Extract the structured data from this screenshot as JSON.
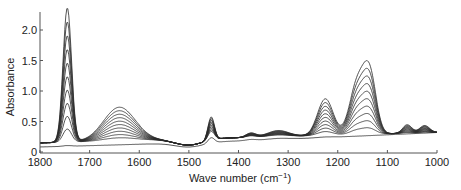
{
  "chart_data": {
    "type": "line",
    "title": "",
    "xlabel": "Wave number (cm⁻¹)",
    "xlabel_base": "Wave number (cm",
    "xlabel_sup": "−1",
    "xlabel_close": ")",
    "ylabel": "Absorbance",
    "xlim": [
      1800,
      1000
    ],
    "ylim": [
      0,
      2.3
    ],
    "x_ticks": [
      1800,
      1700,
      1600,
      1500,
      1400,
      1300,
      1200,
      1100,
      1000
    ],
    "x_tick_labels": [
      "1800",
      "1700",
      "1600",
      "1500",
      "1400",
      "1300",
      "1200",
      "1100",
      "1000"
    ],
    "y_ticks": [
      0,
      0.5,
      1.0,
      1.5,
      2.0
    ],
    "y_tick_labels": [
      "0",
      "0.5",
      "1.0",
      "1.5",
      "2.0"
    ],
    "grid": false,
    "legend": null,
    "series_count": 11,
    "peaks": [
      {
        "center": 1745,
        "width": 12,
        "max_height": 2.2,
        "min_height": 0.02
      },
      {
        "center": 1640,
        "width": 45,
        "max_height": 0.55,
        "min_height": 0.0
      },
      {
        "center": 1455,
        "width": 9,
        "max_height": 0.38,
        "min_height": 0.12
      },
      {
        "center": 1375,
        "width": 14,
        "max_height": 0.07,
        "min_height": 0.02
      },
      {
        "center": 1320,
        "width": 30,
        "max_height": 0.1,
        "min_height": 0.02
      },
      {
        "center": 1225,
        "width": 22,
        "max_height": 0.6,
        "min_height": 0.01
      },
      {
        "center": 1160,
        "width": 22,
        "max_height": 0.85,
        "min_height": 0.0
      },
      {
        "center": 1135,
        "width": 18,
        "max_height": 0.9,
        "min_height": 0.0
      },
      {
        "center": 1060,
        "width": 13,
        "max_height": 0.14,
        "min_height": 0.0
      },
      {
        "center": 1025,
        "width": 14,
        "max_height": 0.12,
        "min_height": 0.0
      }
    ],
    "baseline_start": 0.15,
    "baseline_end": 0.32,
    "series": [
      {
        "name": "spectrum 1",
        "peak_values": {
          "1745": 0.25,
          "1640": 0.1,
          "1455": 0.25,
          "1143": 0.3
        }
      },
      {
        "name": "spectrum 2",
        "peak_values": {
          "1745": 0.4,
          "1640": 0.2,
          "1455": 0.3,
          "1143": 0.45
        }
      },
      {
        "name": "spectrum 3",
        "peak_values": {
          "1745": 0.55,
          "1640": 0.28,
          "1455": 0.35,
          "1143": 0.6
        }
      },
      {
        "name": "spectrum 4",
        "peak_values": {
          "1745": 0.7,
          "1640": 0.35,
          "1455": 0.4,
          "1143": 0.75
        }
      },
      {
        "name": "spectrum 5",
        "peak_values": {
          "1745": 0.9,
          "1640": 0.42,
          "1455": 0.45,
          "1143": 0.9
        }
      },
      {
        "name": "spectrum 6",
        "peak_values": {
          "1745": 1.1,
          "1640": 0.5,
          "1455": 0.5,
          "1143": 1.05
        }
      },
      {
        "name": "spectrum 7",
        "peak_values": {
          "1745": 1.3,
          "1640": 0.57,
          "1455": 0.53,
          "1143": 1.2
        }
      },
      {
        "name": "spectrum 8",
        "peak_values": {
          "1745": 1.5,
          "1640": 0.63,
          "1455": 0.56,
          "1143": 1.35
        }
      },
      {
        "name": "spectrum 9",
        "peak_values": {
          "1745": 1.75,
          "1640": 0.7,
          "1455": 0.59,
          "1143": 1.5
        }
      },
      {
        "name": "spectrum 10",
        "peak_values": {
          "1745": 1.95,
          "1640": 0.75,
          "1455": 0.61,
          "1143": 1.65
        }
      },
      {
        "name": "spectrum 11",
        "peak_values": {
          "1745": 2.2,
          "1640": 0.79,
          "1455": 0.64,
          "1143": 1.85
        }
      }
    ]
  },
  "layout": {
    "plot_left": 40,
    "plot_right": 437,
    "plot_top": 17,
    "plot_bottom": 152,
    "y_per_unit": 61,
    "line_color": "#2a2a2a",
    "axis_color": "#555555"
  }
}
